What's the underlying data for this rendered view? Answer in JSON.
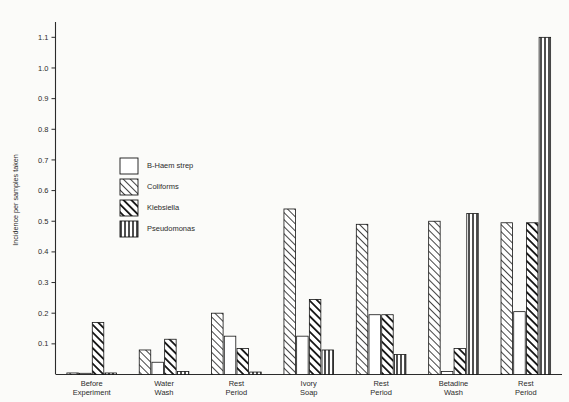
{
  "chart_data": {
    "type": "bar",
    "title": "",
    "subtitle": "",
    "xlabel": "",
    "ylabel": "Incidence per samples taken",
    "ylim": [
      0,
      1.15
    ],
    "ytick_values": [
      0.1,
      0.2,
      0.3,
      0.4,
      0.5,
      0.6,
      0.7,
      0.8,
      0.9,
      1.0,
      1.1
    ],
    "ytick_labels": [
      "0.1",
      "0.2",
      "0.3",
      "0.4",
      "0.5",
      "0.6",
      "0.7",
      "0.8",
      "0.9",
      "1.0",
      "1.1"
    ],
    "grid": false,
    "legend_position": "upper-left-inside",
    "categories": [
      "Before\nExperiment",
      "Water\nWash",
      "Rest\nPeriod",
      "Ivory\nSoap",
      "Rest\nPeriod",
      "Betadine\nWash",
      "Rest\nPeriod"
    ],
    "category_lines": [
      [
        "Before",
        "Experiment"
      ],
      [
        "Water",
        "Wash"
      ],
      [
        "Rest",
        "Period"
      ],
      [
        "Ivory",
        "Soap"
      ],
      [
        "Rest",
        "Period"
      ],
      [
        "Betadine",
        "Wash"
      ],
      [
        "Rest",
        "Period"
      ]
    ],
    "series": [
      {
        "name": "B-Haem strep",
        "pattern": "empty",
        "values": [
          0.0,
          0.04,
          0.125,
          0.125,
          0.195,
          0.01,
          0.205
        ]
      },
      {
        "name": "Coliforms",
        "pattern": "thin-diagonal",
        "values": [
          0.005,
          0.08,
          0.2,
          0.54,
          0.49,
          0.5,
          0.495
        ]
      },
      {
        "name": "Klebsiella",
        "pattern": "thick-diagonal",
        "values": [
          0.17,
          0.115,
          0.085,
          0.245,
          0.195,
          0.085,
          0.495
        ]
      },
      {
        "name": "Pseudomonas",
        "pattern": "vertical",
        "values": [
          0.005,
          0.01,
          0.008,
          0.08,
          0.065,
          0.525,
          1.1
        ]
      }
    ]
  },
  "legend": {
    "items": [
      {
        "label": "B-Haem strep",
        "pattern": "empty"
      },
      {
        "label": "Coliforms",
        "pattern": "thin-diagonal"
      },
      {
        "label": "Klebsiella",
        "pattern": "thick-diagonal"
      },
      {
        "label": "Pseudomonas",
        "pattern": "vertical"
      }
    ]
  },
  "colors": {
    "ink": "#1a1a1a",
    "paper": "#fbfbf9",
    "bar_stroke": "#141414"
  }
}
